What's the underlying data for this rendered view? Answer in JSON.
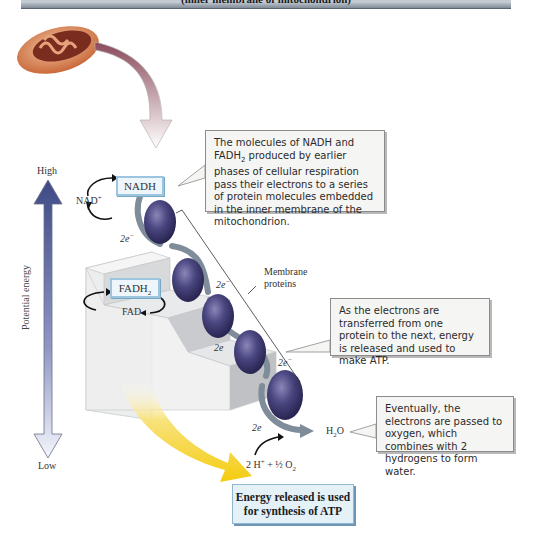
{
  "banner": {
    "subtitle": "(inner membrane of mitochondrion)"
  },
  "axis": {
    "title": "Potential energy",
    "high_label": "High",
    "low_label": "Low"
  },
  "carriers": {
    "nadh": "NADH",
    "nad_plus": "NAD",
    "nad_plus_sup": "+",
    "fadh2": "FADH",
    "fadh2_sub": "2",
    "fad": "FAD"
  },
  "electron_labels": [
    "2e",
    "2e",
    "2e",
    "2e",
    "2e"
  ],
  "electron_sup": "−",
  "membrane_proteins_label": [
    "Membrane",
    "proteins"
  ],
  "products": {
    "water": "H",
    "water_sub": "2",
    "water_tail": "O",
    "reactants": "2 H",
    "reactants_sup": "+",
    "reactants_tail": " + ½ O",
    "reactants_sub": "2"
  },
  "callouts": {
    "nadh_fadh2_prefix": "The molecules of NADH and FADH",
    "nadh_fadh2_sub": "2",
    "nadh_fadh2_rest": " produced by earlier phases of cellular respiration pass their electrons to a series of protein molecules embedded in the inner membrane of the mitochondrion.",
    "atp_transfer": "As the electrons are transferred from one protein to the next, energy is released and used to make ATP.",
    "oxygen": "Eventually, the electrons are passed to oxygen, which combines with 2 hydrogens to form water."
  },
  "atp_box": {
    "text": "Energy released is used for synthesis of ATP"
  },
  "colors": {
    "protein": "#3d3a6b",
    "axis_top": "#3e4a86",
    "axis_bottom": "#eef0f8",
    "energy_yellow": "#f6d21a",
    "carrier_border": "#9cc6df",
    "step_light": "#eaebec",
    "step_dark": "#b9bbbe"
  }
}
